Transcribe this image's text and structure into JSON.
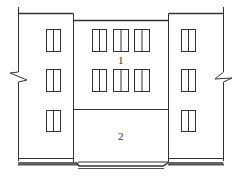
{
  "diagram": {
    "type": "building-elevation",
    "labels": {
      "upper_section": "1",
      "lower_section": "2"
    },
    "colors": {
      "line": "#333333",
      "background": "#ffffff"
    },
    "sections": [
      {
        "name": "left-wing",
        "windows": 3
      },
      {
        "name": "middle-block-upper",
        "label": "1",
        "windows": 6
      },
      {
        "name": "middle-block-lower",
        "label": "2",
        "windows": 0
      },
      {
        "name": "right-wing",
        "windows": 3
      }
    ]
  }
}
